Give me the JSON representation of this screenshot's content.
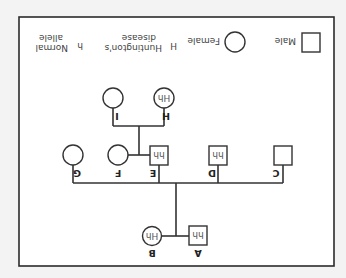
{
  "diagram": {
    "type": "pedigree",
    "orientation": "rotated-180",
    "individuals": [
      {
        "id": "A",
        "sex": "male",
        "genotype": "hh"
      },
      {
        "id": "B",
        "sex": "female",
        "genotype": "Hh"
      },
      {
        "id": "C",
        "sex": "male",
        "genotype": ""
      },
      {
        "id": "D",
        "sex": "male",
        "genotype": "hh"
      },
      {
        "id": "E",
        "sex": "male",
        "genotype": "hh"
      },
      {
        "id": "F",
        "sex": "female",
        "genotype": ""
      },
      {
        "id": "G",
        "sex": "female",
        "genotype": ""
      },
      {
        "id": "H",
        "sex": "female",
        "genotype": "Hh"
      },
      {
        "id": "I",
        "sex": "female",
        "genotype": ""
      }
    ],
    "relationships": [
      {
        "couple": [
          "A",
          "B"
        ],
        "children": [
          "C",
          "D",
          "E",
          "G"
        ]
      },
      {
        "couple": [
          "E",
          "F"
        ],
        "children": [
          "H",
          "I"
        ]
      }
    ]
  },
  "legend": {
    "male": "Male",
    "female": "Female",
    "H_symbol": "H",
    "H_line1": "Huntington's",
    "H_line2": "disease",
    "h_symbol": "h",
    "h_line1": "Normal",
    "h_line2": "allele"
  }
}
